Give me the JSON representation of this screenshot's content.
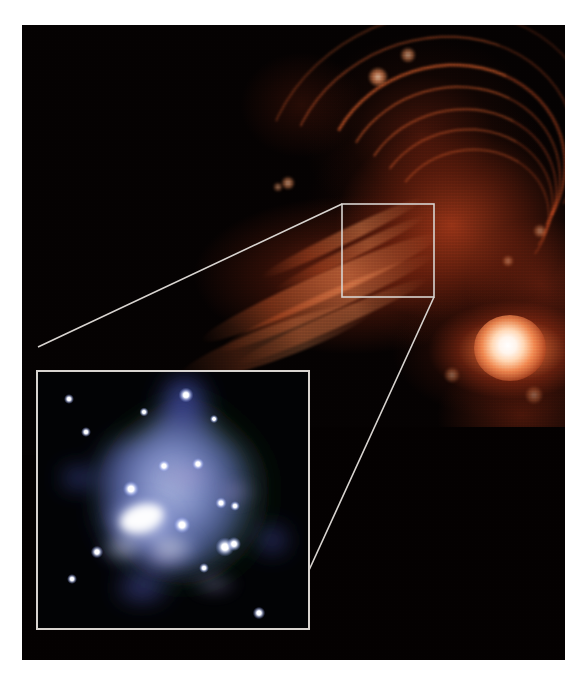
{
  "figure": {
    "kind": "astronomical-composite-image",
    "caption": "",
    "background_color": "#ffffff",
    "frame": {
      "x": 22,
      "y": 25,
      "width": 543,
      "height": 635,
      "sky_color": "#050202"
    }
  },
  "main_view": {
    "name": "wide-field-red-nebula",
    "description": "Wide-field red/orange filamentary nebular emission with arcs, a diagonal streamer and a bright compact source",
    "palette": {
      "deep_space": "#040101",
      "faint_emission": "#6e2008",
      "mid_emission": "#b8381a",
      "bright_emission": "#ec6832",
      "hot_emission": "#f89a5c",
      "core_white": "#ffffff"
    },
    "bright_source": {
      "label": "bright-compact-source",
      "cx": 488,
      "cy": 323,
      "rx": 36,
      "ry": 33
    },
    "emission_cutoff_y": 430,
    "arcs": [
      {
        "left": 300,
        "top": 40,
        "w": 240,
        "h": 210,
        "rot": -18,
        "bw": 3.0,
        "alpha": 0.62
      },
      {
        "left": 318,
        "top": 62,
        "w": 218,
        "h": 190,
        "rot": -16,
        "bw": 2.6,
        "alpha": 0.55
      },
      {
        "left": 336,
        "top": 84,
        "w": 196,
        "h": 170,
        "rot": -14,
        "bw": 2.4,
        "alpha": 0.5
      },
      {
        "left": 352,
        "top": 104,
        "w": 176,
        "h": 152,
        "rot": -12,
        "bw": 2.2,
        "alpha": 0.46
      },
      {
        "left": 368,
        "top": 124,
        "w": 156,
        "h": 134,
        "rot": -10,
        "bw": 2.0,
        "alpha": 0.42
      },
      {
        "left": 262,
        "top": 14,
        "w": 292,
        "h": 248,
        "rot": -22,
        "bw": 2.6,
        "alpha": 0.44
      },
      {
        "left": 236,
        "top": -10,
        "w": 340,
        "h": 284,
        "rot": -24,
        "bw": 2.2,
        "alpha": 0.32
      }
    ],
    "streamers": [
      {
        "left": 168,
        "top": 250,
        "w": 260,
        "h": 26,
        "rot": -24,
        "alpha": 0.72
      },
      {
        "left": 186,
        "top": 268,
        "w": 236,
        "h": 20,
        "rot": -24,
        "alpha": 0.62
      },
      {
        "left": 206,
        "top": 288,
        "w": 210,
        "h": 16,
        "rot": -24,
        "alpha": 0.52
      },
      {
        "left": 230,
        "top": 206,
        "w": 180,
        "h": 14,
        "rot": -26,
        "alpha": 0.66
      },
      {
        "left": 244,
        "top": 222,
        "w": 168,
        "h": 12,
        "rot": -26,
        "alpha": 0.58
      },
      {
        "left": 150,
        "top": 300,
        "w": 210,
        "h": 34,
        "rot": -20,
        "alpha": 0.4
      }
    ],
    "knots": [
      {
        "cx": 356,
        "cy": 52,
        "r": 9,
        "alpha": 0.85
      },
      {
        "cx": 386,
        "cy": 30,
        "r": 7,
        "alpha": 0.7
      },
      {
        "cx": 266,
        "cy": 158,
        "r": 6,
        "alpha": 0.7
      },
      {
        "cx": 256,
        "cy": 162,
        "r": 4,
        "alpha": 0.6
      },
      {
        "cx": 518,
        "cy": 206,
        "r": 6,
        "alpha": 0.55
      },
      {
        "cx": 486,
        "cy": 236,
        "r": 5,
        "alpha": 0.5
      },
      {
        "cx": 430,
        "cy": 350,
        "r": 7,
        "alpha": 0.45
      },
      {
        "cx": 512,
        "cy": 370,
        "r": 8,
        "alpha": 0.42
      }
    ]
  },
  "zoom_callout": {
    "name": "zoom-callout",
    "line_color": "#d8d4d0",
    "line_width": 1.6,
    "marker_box": {
      "label": "region-of-interest-box",
      "x": 320,
      "y": 179,
      "width": 92,
      "height": 93
    },
    "leader_lines": [
      {
        "from": "marker-top-left",
        "x1": 320,
        "y1": 179,
        "x2": 16,
        "y2": 322
      },
      {
        "from": "marker-bottom-right",
        "x1": 412,
        "y1": 272,
        "x2": 272,
        "y2": 578
      }
    ]
  },
  "inset_view": {
    "name": "inset-zoom-panel",
    "description": "Magnified X-ray/optical view: diffuse blue-violet cloud with green outer halo and white point sources",
    "frame": {
      "x": 14,
      "y": 345,
      "width": 270,
      "height": 256
    },
    "border_color": "#d8d4d0",
    "palette": {
      "panel_background": "#020305",
      "halo_green": "#2f5a2a",
      "cloud_blue": "#6b79c8",
      "cloud_violet": "#8a86c4",
      "cloud_core": "#cfd6f5",
      "point_source": "#ffffff"
    },
    "point_sources": [
      {
        "cx": 31,
        "cy": 27,
        "r": 2.4
      },
      {
        "cx": 48,
        "cy": 60,
        "r": 2.4
      },
      {
        "cx": 106,
        "cy": 40,
        "r": 2.2
      },
      {
        "cx": 148,
        "cy": 23,
        "r": 3.6
      },
      {
        "cx": 176,
        "cy": 47,
        "r": 2.0
      },
      {
        "cx": 126,
        "cy": 94,
        "r": 3.0
      },
      {
        "cx": 160,
        "cy": 92,
        "r": 3.0
      },
      {
        "cx": 93,
        "cy": 117,
        "r": 4.0
      },
      {
        "cx": 183,
        "cy": 131,
        "r": 2.8
      },
      {
        "cx": 197,
        "cy": 134,
        "r": 2.4
      },
      {
        "cx": 144,
        "cy": 153,
        "r": 4.2
      },
      {
        "cx": 187,
        "cy": 175,
        "r": 4.6
      },
      {
        "cx": 196,
        "cy": 172,
        "r": 3.4
      },
      {
        "cx": 59,
        "cy": 180,
        "r": 3.0
      },
      {
        "cx": 166,
        "cy": 196,
        "r": 2.4
      },
      {
        "cx": 34,
        "cy": 207,
        "r": 2.4
      },
      {
        "cx": 221,
        "cy": 241,
        "r": 3.0
      },
      {
        "cx": 186,
        "cy": 258,
        "r": 2.4
      }
    ],
    "bright_elongated_source": {
      "cx": 104,
      "cy": 146,
      "rx": 22,
      "ry": 13,
      "rot": -18
    }
  }
}
